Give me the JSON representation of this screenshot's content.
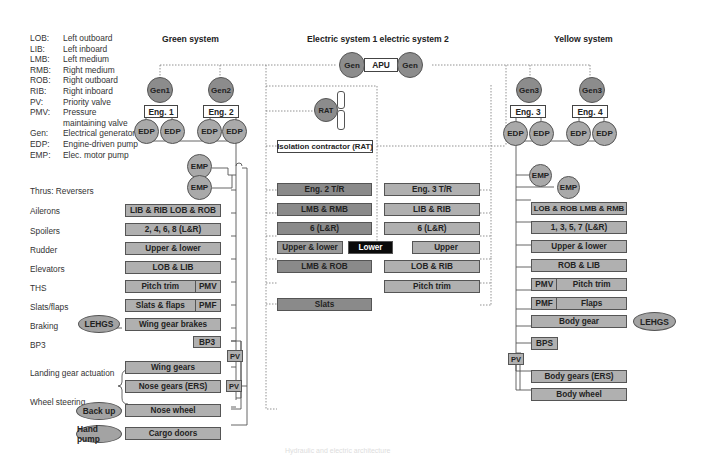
{
  "legend": [
    {
      "abbr": "LOB:",
      "meaning": "Left outboard"
    },
    {
      "abbr": "LIB:",
      "meaning": "Left inboard"
    },
    {
      "abbr": "LMB:",
      "meaning": "Left medium"
    },
    {
      "abbr": "RMB:",
      "meaning": "Right medium"
    },
    {
      "abbr": "ROB:",
      "meaning": "Right outboard"
    },
    {
      "abbr": "RIB:",
      "meaning": "Right inboard"
    },
    {
      "abbr": "PV:",
      "meaning": "Priority valve"
    },
    {
      "abbr": "PMV:",
      "meaning": "Pressure"
    },
    {
      "abbr": "",
      "meaning": "maintaining valve"
    },
    {
      "abbr": "Gen:",
      "meaning": "Electrical generator"
    },
    {
      "abbr": "EDP:",
      "meaning": "Engine-driven pump"
    },
    {
      "abbr": "EMP:",
      "meaning": "Elec. motor pump"
    }
  ],
  "titles": {
    "green": "Green system",
    "electric": "Electric system 1 electric system 2",
    "yellow": "Yellow system"
  },
  "apu": {
    "gen_left": "Gen",
    "label": "APU",
    "gen_right": "Gen"
  },
  "green": {
    "gens": [
      "Gen1",
      "Gen2"
    ],
    "engines": [
      "Eng. 1",
      "Eng. 2"
    ],
    "edp": [
      "EDP",
      "EDP",
      "EDP",
      "EDP"
    ],
    "emp": [
      "EMP",
      "EMP"
    ],
    "rows": {
      "ailerons": "LIB & RIB LOB & ROB",
      "spoilers": "2, 4, 6, 8 (L&R)",
      "rudder": "Upper & lower",
      "elevators": "LOB & LIB",
      "ths_main": "Pitch trim",
      "ths_valve": "PMV",
      "slats_main": "Slats & flaps",
      "slats_valve": "PMF",
      "braking": "Wing gear brakes",
      "bp3": "BP3",
      "pv1": "PV",
      "wing_gears": "Wing gears",
      "nose_gears": "Nose gears (ERS)",
      "pv2": "PV",
      "nose_wheel": "Nose wheel",
      "cargo": "Cargo doors"
    },
    "ovals": {
      "lehgs": "LEHGS",
      "backup": "Back up",
      "hand_pump": "Hand pump"
    }
  },
  "functions": {
    "thrust_reversers": "Thrus: Reversers",
    "ailerons": "Ailerons",
    "spoilers": "Spoilers",
    "rudder": "Rudder",
    "elevators": "Elevators",
    "ths": "THS",
    "slats_flaps": "Slats/flaps",
    "braking": "Braking",
    "bp3": "BP3",
    "landing_gear": "Landing gear actuation",
    "wheel_steering": "Wheel steering"
  },
  "electric1": {
    "rat": "RAT",
    "isolation": "Isolation contractor (RAT)",
    "rows": {
      "reverser": "Eng. 2 T/R",
      "ailerons": "LMB & RMB",
      "spoilers": "6 (L&R)",
      "rudder": "Upper & lower",
      "rudder_black": "Lower",
      "elevators": "LMB & ROB",
      "slats": "Slats"
    }
  },
  "electric2": {
    "rows": {
      "reverser": "Eng. 3 T/R",
      "ailerons": "LIB & RIB",
      "spoilers": "6 (L&R)",
      "rudder": "Upper",
      "elevators": "LOB & RIB",
      "ths": "Pitch trim"
    }
  },
  "yellow": {
    "gens": [
      "Gen3",
      "Gen3"
    ],
    "engines": [
      "Eng. 3",
      "Eng. 4"
    ],
    "edp": [
      "EDP",
      "EDP",
      "EDP",
      "EDP"
    ],
    "emp": [
      "EMP",
      "EMP"
    ],
    "rows": {
      "ailerons": "LOB & ROB LMB & RMB",
      "spoilers": "1, 3, 5, 7 (L&R)",
      "rudder": "Upper & lower",
      "elevators": "ROB & LIB",
      "ths_valve": "PMV",
      "ths_main": "Pitch trim",
      "flaps_valve": "PMF",
      "flaps_main": "Flaps",
      "body_gear": "Body gear",
      "bps": "BPS",
      "pv": "PV",
      "body_gears_ers": "Body gears (ERS)",
      "body_wheel": "Body wheel"
    },
    "ovals": {
      "lehgs": "LEHGS"
    }
  },
  "caption": "Hydraulic and electric architecture"
}
